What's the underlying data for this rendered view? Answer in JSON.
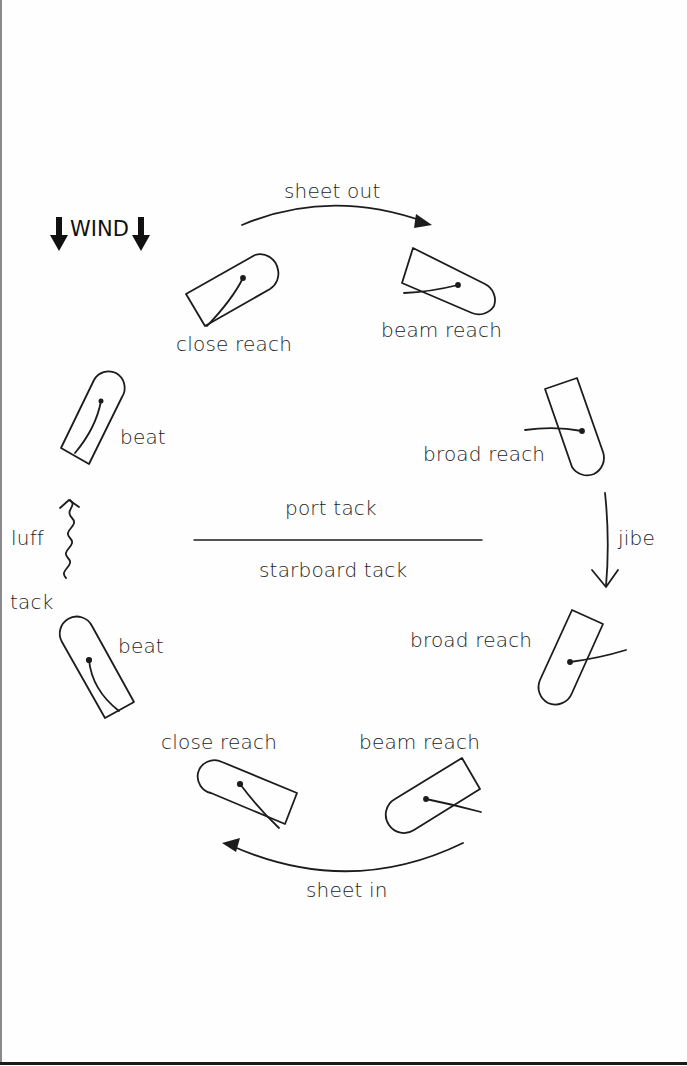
{
  "diagram": {
    "wind_label": "WIND",
    "wind_direction": "down",
    "divider": {
      "above_label": "port tack",
      "below_label": "starboard tack"
    },
    "transitions": {
      "top": "sheet out",
      "right": "jibe",
      "bottom": "sheet in",
      "left_upper": "luff",
      "left_lower": "tack"
    },
    "boats": [
      {
        "id": "close-reach-port",
        "label": "close reach",
        "tack": "port"
      },
      {
        "id": "beam-reach-port",
        "label": "beam reach",
        "tack": "port"
      },
      {
        "id": "broad-reach-port",
        "label": "broad reach",
        "tack": "port"
      },
      {
        "id": "beat-port",
        "label": "beat",
        "tack": "port"
      },
      {
        "id": "beat-starboard",
        "label": "beat",
        "tack": "starboard"
      },
      {
        "id": "broad-reach-starboard",
        "label": "broad reach",
        "tack": "starboard"
      },
      {
        "id": "beam-reach-starboard",
        "label": "beam reach",
        "tack": "starboard"
      },
      {
        "id": "close-reach-starboard",
        "label": "close reach",
        "tack": "starboard"
      }
    ],
    "colors": {
      "ink": "#1c1c1c",
      "background": "#fefefe"
    }
  }
}
